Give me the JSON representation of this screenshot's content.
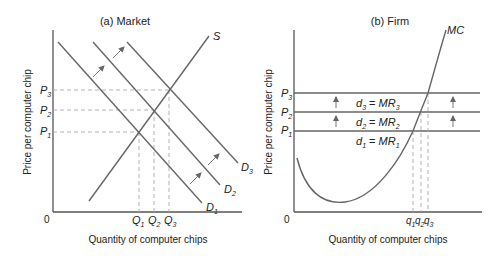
{
  "panels": {
    "market": {
      "title": "(a) Market",
      "ylabel": "Price per computer chip",
      "xlabel": "Quantity of computer chips",
      "origin": "0",
      "supply_label": "S",
      "demand_labels": [
        {
          "main": "D",
          "sub": "1"
        },
        {
          "main": "D",
          "sub": "2"
        },
        {
          "main": "D",
          "sub": "3"
        }
      ],
      "price_labels": [
        {
          "main": "P",
          "sub": "1"
        },
        {
          "main": "P",
          "sub": "2"
        },
        {
          "main": "P",
          "sub": "3"
        }
      ],
      "quantity_labels": [
        {
          "main": "Q",
          "sub": "1"
        },
        {
          "main": "Q",
          "sub": "2"
        },
        {
          "main": "Q",
          "sub": "3"
        }
      ]
    },
    "firm": {
      "title": "(b) Firm",
      "ylabel": "Price per computer chip",
      "xlabel": "Quantity of computer chips",
      "origin": "0",
      "mc_label": "MC",
      "price_labels": [
        {
          "main": "P",
          "sub": "1"
        },
        {
          "main": "P",
          "sub": "2"
        },
        {
          "main": "P",
          "sub": "3"
        }
      ],
      "demand_mr_labels": [
        {
          "d": "d",
          "dsub": "1",
          "eq": " = ",
          "mr": "MR",
          "mrsub": "1"
        },
        {
          "d": "d",
          "dsub": "2",
          "eq": " = ",
          "mr": "MR",
          "mrsub": "2"
        },
        {
          "d": "d",
          "dsub": "3",
          "eq": " = ",
          "mr": "MR",
          "mrsub": "3"
        }
      ],
      "quantity_labels": [
        {
          "main": "q",
          "sub": "1"
        },
        {
          "main": "q",
          "sub": "2"
        },
        {
          "main": "q",
          "sub": "3"
        }
      ]
    }
  },
  "colors": {
    "axis": "#555555",
    "curve": "#666666",
    "guide": "#aaaaaa",
    "text": "#222222"
  }
}
